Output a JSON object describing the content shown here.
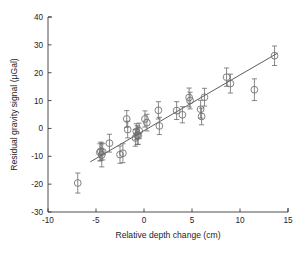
{
  "chart_data": {
    "type": "scatter",
    "title": "",
    "xlabel": "Relative depth change (cm)",
    "ylabel": "Residual gravity signal (μGal)",
    "xlim": [
      -10,
      15
    ],
    "ylim": [
      -30,
      40
    ],
    "xticks": [
      -10,
      -5,
      0,
      5,
      10,
      15
    ],
    "yticks": [
      -30,
      -20,
      -10,
      0,
      10,
      20,
      30,
      40
    ],
    "xtick_labels": [
      "-10",
      "-5",
      "0",
      "5",
      "10",
      "15"
    ],
    "ytick_labels": [
      "-30",
      "-20",
      "-10",
      "0",
      "10",
      "20",
      "30",
      "40"
    ],
    "grid": false,
    "legend": null,
    "marker_style": "open-circle",
    "error_bars": "vertical",
    "series": [
      {
        "name": "Residual gravity vs relative depth change",
        "points": [
          {
            "x": -6.9,
            "y": -19.6,
            "yerr": 3.6
          },
          {
            "x": -4.6,
            "y": -8.6,
            "yerr": 3.1
          },
          {
            "x": -4.5,
            "y": -8.2,
            "yerr": 3.3
          },
          {
            "x": -4.4,
            "y": -9.5,
            "yerr": 4.3
          },
          {
            "x": -4.3,
            "y": -8.4,
            "yerr": 2.9
          },
          {
            "x": -3.6,
            "y": -5.3,
            "yerr": 3.2
          },
          {
            "x": -2.5,
            "y": -9.4,
            "yerr": 3.1
          },
          {
            "x": -2.2,
            "y": -8.9,
            "yerr": 3.4
          },
          {
            "x": -1.8,
            "y": 3.4,
            "yerr": 3.0
          },
          {
            "x": -1.7,
            "y": -0.4,
            "yerr": 3.0
          },
          {
            "x": -0.9,
            "y": -3.4,
            "yerr": 3.0
          },
          {
            "x": -0.8,
            "y": -1.1,
            "yerr": 2.8
          },
          {
            "x": -0.7,
            "y": -2.4,
            "yerr": 3.4
          },
          {
            "x": -0.6,
            "y": -2.6,
            "yerr": 3.1
          },
          {
            "x": -0.5,
            "y": -0.9,
            "yerr": 2.8
          },
          {
            "x": 0.1,
            "y": 3.4,
            "yerr": 2.9
          },
          {
            "x": 0.3,
            "y": 2.1,
            "yerr": 3.0
          },
          {
            "x": 1.5,
            "y": 6.5,
            "yerr": 3.1
          },
          {
            "x": 1.6,
            "y": 0.9,
            "yerr": 3.1
          },
          {
            "x": 3.4,
            "y": 6.4,
            "yerr": 3.2
          },
          {
            "x": 4.0,
            "y": 4.9,
            "yerr": 2.9
          },
          {
            "x": 4.7,
            "y": 11.1,
            "yerr": 3.4
          },
          {
            "x": 4.8,
            "y": 10.0,
            "yerr": 3.0
          },
          {
            "x": 5.9,
            "y": 6.9,
            "yerr": 3.2
          },
          {
            "x": 6.0,
            "y": 4.3,
            "yerr": 3.0
          },
          {
            "x": 6.3,
            "y": 11.2,
            "yerr": 3.2
          },
          {
            "x": 8.6,
            "y": 18.4,
            "yerr": 3.3
          },
          {
            "x": 9.0,
            "y": 16.1,
            "yerr": 3.4
          },
          {
            "x": 11.5,
            "y": 13.9,
            "yerr": 3.9
          },
          {
            "x": 13.6,
            "y": 26.1,
            "yerr": 3.5
          }
        ]
      }
    ],
    "fit_line": {
      "name": "linear regression",
      "x1": -5.6,
      "y1": -12.0,
      "x2": 13.9,
      "y2": 27.0,
      "slope": 2.0,
      "intercept": -0.8
    }
  }
}
